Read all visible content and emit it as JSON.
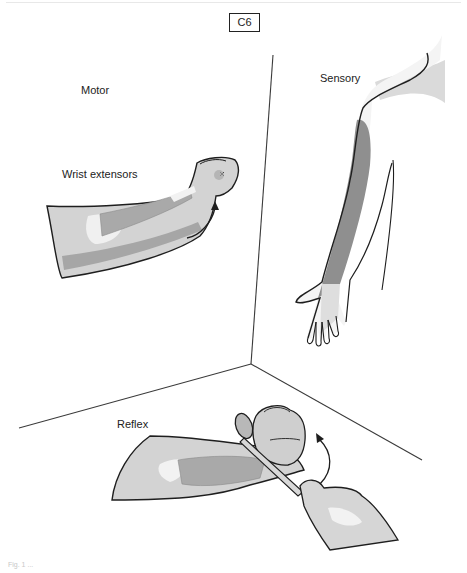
{
  "figure": {
    "nerve_root_label": "C6",
    "panels": {
      "motor": {
        "title": "Motor",
        "muscle_label": "Wrist extensors"
      },
      "sensory": {
        "title": "Sensory"
      },
      "reflex": {
        "title": "Reflex"
      }
    },
    "caption": "Fig. 1 ...",
    "colors": {
      "outline": "#1e1e1e",
      "skin": "#d3d3d3",
      "skin_light": "#e6e6e6",
      "highlight": "#f2f2f2",
      "muscle": "#a9a9a9",
      "dermatome_dark": "#8f8f8f",
      "dermatome_light": "#dadada",
      "room_lines": "#3a3a3a"
    }
  }
}
